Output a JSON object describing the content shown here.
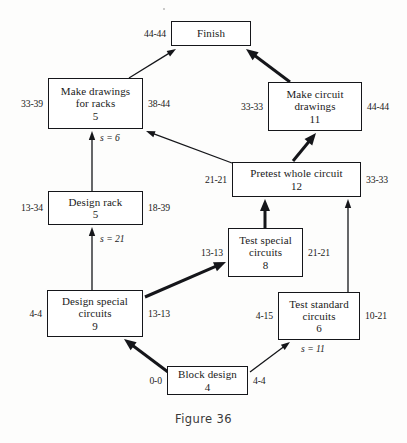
{
  "figure": {
    "caption": "Figure 36"
  },
  "nodes": [
    {
      "id": "finish",
      "name": "finish",
      "lines": [
        "Finish"
      ],
      "duration": "",
      "left_tag": "44-44",
      "right_tag": "",
      "x": 171,
      "y": 21,
      "w": 80,
      "h": 25
    },
    {
      "id": "make-drawings-for-racks",
      "name": "make-drawings-for-racks",
      "lines": [
        "Make drawings",
        "for racks"
      ],
      "duration": "5",
      "left_tag": "33-39",
      "right_tag": "38-44",
      "x": 48,
      "y": 78,
      "w": 95,
      "h": 51
    },
    {
      "id": "make-circuit-drawings",
      "name": "make-circuit-drawings",
      "lines": [
        "Make circuit",
        "drawings"
      ],
      "duration": "11",
      "left_tag": "33-33",
      "right_tag": "44-44",
      "x": 268,
      "y": 82,
      "w": 94,
      "h": 49
    },
    {
      "id": "pretest-whole-circuit",
      "name": "pretest-whole-circuit",
      "lines": [
        "Pretest whole circuit"
      ],
      "duration": "12",
      "left_tag": "21-21",
      "right_tag": "33-33",
      "x": 232,
      "y": 162,
      "w": 129,
      "h": 35
    },
    {
      "id": "design-rack",
      "name": "design-rack",
      "lines": [
        "Design rack"
      ],
      "duration": "5",
      "left_tag": "13-34",
      "right_tag": "18-39",
      "x": 48,
      "y": 191,
      "w": 95,
      "h": 34
    },
    {
      "id": "test-special-circuits",
      "name": "test-special-circuits",
      "lines": [
        "Test special",
        "circuits"
      ],
      "duration": "8",
      "left_tag": "13-13",
      "right_tag": "21-21",
      "x": 228,
      "y": 228,
      "w": 75,
      "h": 49
    },
    {
      "id": "design-special-circuits",
      "name": "design-special-circuits",
      "lines": [
        "Design special",
        "circuits"
      ],
      "duration": "9",
      "left_tag": "4-4",
      "right_tag": "13-13",
      "x": 47,
      "y": 290,
      "w": 96,
      "h": 47
    },
    {
      "id": "test-standard-circuits",
      "name": "test-standard-circuits",
      "lines": [
        "Test standard",
        "circuits"
      ],
      "duration": "6",
      "left_tag": "4-15",
      "right_tag": "10-21",
      "x": 278,
      "y": 292,
      "w": 82,
      "h": 48
    },
    {
      "id": "block-design",
      "name": "block-design",
      "lines": [
        "Block design"
      ],
      "duration": "4",
      "left_tag": "0-0",
      "right_tag": "4-4",
      "x": 167,
      "y": 366,
      "w": 81,
      "h": 29
    }
  ],
  "slack_labels": [
    {
      "id": "slack-make-drawings-for-racks",
      "text": "s = 6",
      "x": 100,
      "y": 132
    },
    {
      "id": "slack-design-rack",
      "text": "s = 21",
      "x": 100,
      "y": 233
    },
    {
      "id": "slack-test-standard-circuits",
      "text": "s = 11",
      "x": 301,
      "y": 343
    }
  ],
  "edges": [
    {
      "id": "edge-make-drawings-to-finish",
      "from": "make-drawings-for-racks",
      "to": "finish",
      "weight": "thin",
      "x1": 129,
      "y1": 78,
      "x2": 176,
      "y2": 49
    },
    {
      "id": "edge-make-circuit-drawings-to-finish",
      "from": "make-circuit-drawings",
      "to": "finish",
      "weight": "thick",
      "x1": 290,
      "y1": 82,
      "x2": 246,
      "y2": 49
    },
    {
      "id": "edge-design-rack-to-make-drawings",
      "from": "design-rack",
      "to": "make-drawings-for-racks",
      "weight": "thin",
      "x1": 92,
      "y1": 191,
      "x2": 92,
      "y2": 131
    },
    {
      "id": "edge-pretest-to-make-drawings",
      "from": "pretest-whole-circuit",
      "to": "make-drawings-for-racks",
      "weight": "thin",
      "x1": 232,
      "y1": 163,
      "x2": 146,
      "y2": 131
    },
    {
      "id": "edge-pretest-to-make-circuit-drawings",
      "from": "pretest-whole-circuit",
      "to": "make-circuit-drawings",
      "weight": "thick",
      "x1": 293,
      "y1": 161,
      "x2": 316,
      "y2": 133
    },
    {
      "id": "edge-design-special-to-design-rack",
      "from": "design-special-circuits",
      "to": "design-rack",
      "weight": "thin",
      "x1": 92,
      "y1": 290,
      "x2": 92,
      "y2": 227
    },
    {
      "id": "edge-test-special-to-pretest",
      "from": "test-special-circuits",
      "to": "pretest-whole-circuit",
      "weight": "thick",
      "x1": 265,
      "y1": 228,
      "x2": 265,
      "y2": 199
    },
    {
      "id": "edge-test-standard-to-pretest",
      "from": "test-standard-circuits",
      "to": "pretest-whole-circuit",
      "weight": "thin",
      "x1": 348,
      "y1": 292,
      "x2": 348,
      "y2": 199
    },
    {
      "id": "edge-design-special-to-test-special",
      "from": "design-special-circuits",
      "to": "test-special-circuits",
      "weight": "thick",
      "x1": 145,
      "y1": 297,
      "x2": 226,
      "y2": 262
    },
    {
      "id": "edge-block-design-to-design-special",
      "from": "block-design",
      "to": "design-special-circuits",
      "weight": "thick",
      "x1": 168,
      "y1": 372,
      "x2": 124,
      "y2": 339
    },
    {
      "id": "edge-block-design-to-test-standard",
      "from": "block-design",
      "to": "test-standard-circuits",
      "weight": "thin",
      "x1": 250,
      "y1": 372,
      "x2": 290,
      "y2": 342
    }
  ],
  "colors": {
    "ink": "#15161a",
    "paper": "#fdfdfc",
    "caption": "#3a3a3a"
  }
}
